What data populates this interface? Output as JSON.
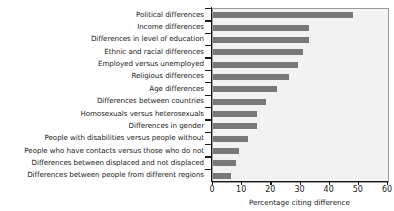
{
  "chart_data": {
    "type": "bar",
    "orientation": "horizontal",
    "title": "",
    "xlabel": "Percentage citing difference",
    "ylabel": "",
    "xlim": [
      0,
      60
    ],
    "ylim": null,
    "xticks": [
      0,
      10,
      20,
      30,
      40,
      50,
      60
    ],
    "grid": false,
    "legend": null,
    "bar_color": "#787878",
    "plot_background": "#f2f2f2",
    "axis_color": "#1a1a1a",
    "categories": [
      "Political differences",
      "Income differences",
      "Differences in level of education",
      "Ethnic and racial differences",
      "Employed versus unemployed",
      "Religious differences",
      "Age differences",
      "Differences between countries",
      "Homosexuals versus heterosexuals",
      "Differences in gender",
      "People with disabilities versus people without",
      "People who have contacts versus those who do not",
      "Differences between displaced and not displaced",
      "Differences between people from different regions"
    ],
    "values": [
      48,
      33,
      33,
      31,
      29,
      26,
      22,
      18,
      15,
      15,
      12,
      9,
      8,
      6
    ]
  }
}
